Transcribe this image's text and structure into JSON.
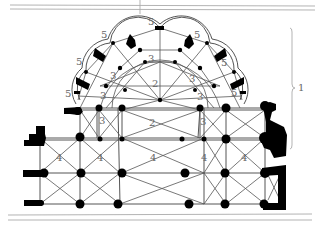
{
  "diagram": {
    "type": "architectural-plan",
    "labels": {
      "apse_height_bracket": "1",
      "central_vault_upper": "2",
      "central_vault_lower": "2",
      "chapel_vault": "3",
      "nave_bay": "4",
      "radiating_chapel": "5"
    },
    "label_instances": [
      {
        "id": "label-1",
        "text": "1",
        "x": 298,
        "y": 91
      },
      {
        "id": "label-2-upper",
        "text": "2",
        "x": 152,
        "y": 87
      },
      {
        "id": "label-2-lower",
        "text": "2",
        "x": 149,
        "y": 126
      },
      {
        "id": "label-3-center",
        "text": "3",
        "x": 148,
        "y": 62
      },
      {
        "id": "label-3-l1",
        "text": "3",
        "x": 110,
        "y": 79
      },
      {
        "id": "label-3-l2",
        "text": "3",
        "x": 100,
        "y": 99
      },
      {
        "id": "label-3-l3",
        "text": "3",
        "x": 99,
        "y": 124
      },
      {
        "id": "label-3-r1",
        "text": "3",
        "x": 189,
        "y": 82
      },
      {
        "id": "label-3-r2",
        "text": "3",
        "x": 197,
        "y": 100
      },
      {
        "id": "label-3-r3",
        "text": "3",
        "x": 200,
        "y": 125
      },
      {
        "id": "label-4-a",
        "text": "4",
        "x": 56,
        "y": 161
      },
      {
        "id": "label-4-b",
        "text": "4",
        "x": 97,
        "y": 161
      },
      {
        "id": "label-4-c",
        "text": "4",
        "x": 150,
        "y": 161
      },
      {
        "id": "label-4-d",
        "text": "4",
        "x": 201,
        "y": 161
      },
      {
        "id": "label-4-e",
        "text": "4",
        "x": 241,
        "y": 161
      },
      {
        "id": "label-5-top",
        "text": "5",
        "x": 148,
        "y": 25
      },
      {
        "id": "label-5-l1",
        "text": "5",
        "x": 101,
        "y": 38
      },
      {
        "id": "label-5-l2",
        "text": "5",
        "x": 76,
        "y": 65
      },
      {
        "id": "label-5-l3",
        "text": "5",
        "x": 65,
        "y": 97
      },
      {
        "id": "label-5-r1",
        "text": "5",
        "x": 194,
        "y": 38
      },
      {
        "id": "label-5-r2",
        "text": "5",
        "x": 221,
        "y": 66
      },
      {
        "id": "label-5-r3",
        "text": "5",
        "x": 231,
        "y": 96
      }
    ],
    "colors": {
      "ink": "#000000",
      "line": "#555555",
      "label": "#666666",
      "frame": "#aaaaaa",
      "background": "#ffffff"
    }
  }
}
